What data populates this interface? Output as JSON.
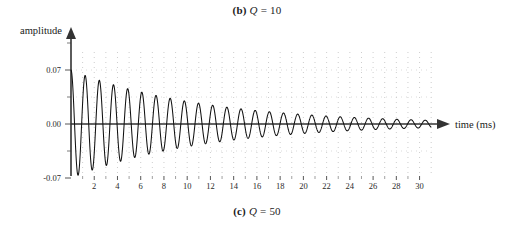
{
  "caption_top": {
    "label": "(b)",
    "symbol": "Q",
    "equals": " = 10"
  },
  "caption_bottom": {
    "label": "(c)",
    "symbol": "Q",
    "equals": " = 50"
  },
  "chart_data": {
    "type": "line",
    "title": "",
    "xlabel": "time (ms)",
    "ylabel": "amplitude",
    "xlim": [
      0,
      31.5
    ],
    "ylim": [
      -0.09,
      0.09
    ],
    "grid": true,
    "grid_style": "dotted",
    "legend": null,
    "x_ticks": [
      2,
      4,
      6,
      8,
      10,
      12,
      14,
      16,
      18,
      20,
      22,
      24,
      26,
      28,
      30
    ],
    "x_tick_labels": [
      "2",
      "4",
      "6",
      "8",
      "10",
      "12",
      "14",
      "16",
      "18",
      "20",
      "22",
      "24",
      "26",
      "28",
      "30"
    ],
    "x_minor_ticks": [
      1,
      3,
      5,
      7,
      9,
      11,
      13,
      15,
      17,
      19,
      21,
      23,
      25,
      27,
      29
    ],
    "y_ticks": [
      -0.07,
      0.0,
      0.07
    ],
    "y_tick_labels": [
      "-0.07",
      "0.00",
      "0.07"
    ],
    "series": [
      {
        "name": "damped oscillation",
        "description": "exponentially damped sinusoid, Q = 10",
        "amplitude0": 0.07,
        "frequency_cycles_per_ms": 0.82,
        "decay_time_constant_ms": 11.5,
        "color": "#111111"
      }
    ],
    "axis_arrow_x": true,
    "axis_arrow_y": true
  }
}
